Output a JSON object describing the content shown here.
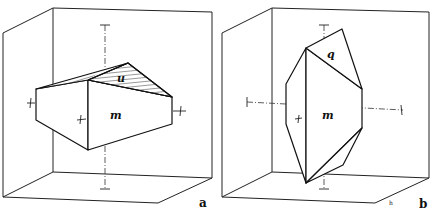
{
  "figure": {
    "panels": [
      {
        "id": "a",
        "label": "a",
        "faces": [
          {
            "name": "m",
            "label": "m"
          },
          {
            "name": "u",
            "label": "u",
            "hatched": true
          }
        ]
      },
      {
        "id": "b",
        "label": "b",
        "faces": [
          {
            "name": "m",
            "label": "m"
          },
          {
            "name": "q",
            "label": "q"
          }
        ],
        "corner_mark": "h"
      }
    ]
  }
}
